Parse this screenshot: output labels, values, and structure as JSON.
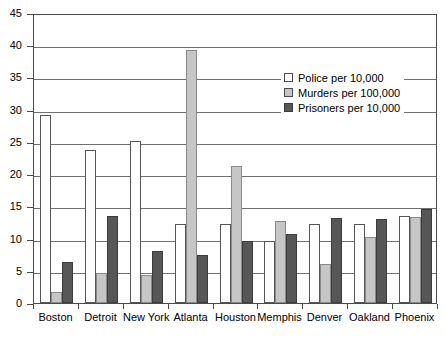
{
  "chart_data": {
    "type": "bar",
    "title": "",
    "subtitle": "",
    "xlabel": "",
    "ylabel": "",
    "ylim": [
      0,
      45
    ],
    "ytick_step": 5,
    "yticks": [
      "0",
      "5",
      "10",
      "15",
      "20",
      "25",
      "30",
      "35",
      "40",
      "45"
    ],
    "grid": true,
    "legend_position": "upper-right-inside",
    "categories": [
      "Boston",
      "Detroit",
      "New York",
      "Atlanta",
      "Houston",
      "Memphis",
      "Denver",
      "Oakland",
      "Phoenix"
    ],
    "series": [
      {
        "name": "Police per 10,000",
        "color": "#ffffff",
        "values": [
          29.2,
          23.8,
          25.2,
          12.3,
          12.2,
          9.7,
          12.2,
          12.3,
          13.5
        ]
      },
      {
        "name": "Murders per 100,000",
        "color": "#c6c6c6",
        "values": [
          1.7,
          4.6,
          4.3,
          39.3,
          21.3,
          12.7,
          6.0,
          10.2,
          13.3
        ]
      },
      {
        "name": "Prisoners per 10,000",
        "color": "#575757",
        "values": [
          6.4,
          13.5,
          8.0,
          7.4,
          9.6,
          10.7,
          13.2,
          13.1,
          14.6
        ]
      }
    ]
  },
  "legend": {
    "items": [
      {
        "label": "Police per 10,000",
        "swatch": "police-swatch"
      },
      {
        "label": "Murders per 100,000",
        "swatch": "murders-swatch"
      },
      {
        "label": "Prisoners per 10,000",
        "swatch": "prisoners-swatch"
      }
    ]
  },
  "colors": {
    "police": "#ffffff",
    "murders": "#c6c6c6",
    "prisoners": "#575757",
    "axis": "#4a4a4a",
    "grid": "#707070",
    "background": "#ffffff"
  }
}
